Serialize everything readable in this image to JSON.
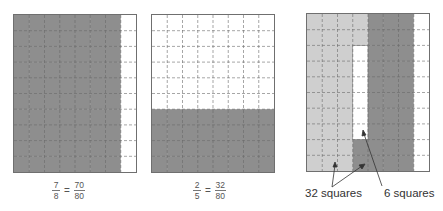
{
  "colors": {
    "dark_shade": "#8e8e8e",
    "light_shade": "#cfcfcf",
    "empty": "#ffffff",
    "border": "#6f6f6f",
    "gridline": "#6a6a6a"
  },
  "grids": [
    {
      "id": "grid-seven-eighths",
      "cols": 8,
      "rows": 10,
      "description": "First 7 of 8 columns shaded dark",
      "cells": [
        "DDDDDDDW",
        "DDDDDDDW",
        "DDDDDDDW",
        "DDDDDDDW",
        "DDDDDDDW",
        "DDDDDDDW",
        "DDDDDDDW",
        "DDDDDDDW",
        "DDDDDDDW",
        "DDDDDDDW"
      ],
      "label": {
        "lhs_num": "7",
        "lhs_den": "8",
        "eq": "=",
        "rhs_num": "70",
        "rhs_den": "80"
      }
    },
    {
      "id": "grid-two-fifths",
      "cols": 8,
      "rows": 10,
      "description": "Bottom 4 of 10 rows shaded dark",
      "cells": [
        "WWWWWWWW",
        "WWWWWWWW",
        "WWWWWWWW",
        "WWWWWWWW",
        "WWWWWWWW",
        "WWWWWWWW",
        "DDDDDDDD",
        "DDDDDDDD",
        "DDDDDDDD",
        "DDDDDDDD"
      ],
      "label": {
        "lhs_num": "2",
        "lhs_den": "5",
        "eq": "=",
        "rhs_num": "32",
        "rhs_den": "80"
      }
    },
    {
      "id": "grid-comparison",
      "cols": 8,
      "rows": 10,
      "description": "32 light squares plus overlap region; 6 white squares difference",
      "cells": [
        "LLLLDDDW",
        "LLLLDDDW",
        "LLLWDDDW",
        "LLLWDDDW",
        "LLLWDDDW",
        "LLLWDDDW",
        "LLLWDDDW",
        "LLLWDDDW",
        "LLLDDDDW",
        "LLLDDDDW"
      ],
      "annotations": [
        {
          "text": "32 squares"
        },
        {
          "text": "6 squares"
        }
      ]
    }
  ]
}
